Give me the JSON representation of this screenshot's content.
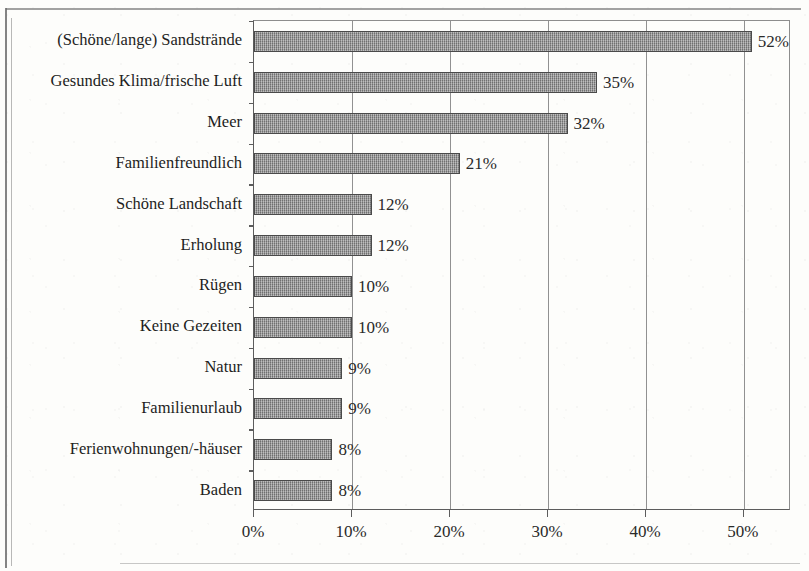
{
  "chart_data": {
    "type": "bar",
    "orientation": "horizontal",
    "title": "",
    "subtitle": "",
    "xlabel": "",
    "ylabel": "",
    "grid": true,
    "legend": null,
    "xlim": [
      0,
      54.8
    ],
    "xtick_values": [
      0,
      10,
      20,
      30,
      40,
      50
    ],
    "xtick_labels": [
      "0%",
      "10%",
      "20%",
      "30%",
      "40%",
      "50%"
    ],
    "value_suffix": "%",
    "categories": [
      "(Schöne/lange) Sandstrände",
      "Gesundes Klima/frische Luft",
      "Meer",
      "Familienfreundlich",
      "Schöne Landschaft",
      "Erholung",
      "Rügen",
      "Keine Gezeiten",
      "Natur",
      "Familienurlaub",
      "Ferienwohnungen/-häuser",
      "Baden"
    ],
    "values": [
      52,
      35,
      32,
      21,
      12,
      12,
      10,
      10,
      9,
      9,
      8,
      8
    ],
    "value_labels": [
      "52%",
      "35%",
      "32%",
      "21%",
      "12%",
      "12%",
      "10%",
      "10%",
      "9%",
      "9%",
      "8%",
      "8%"
    ],
    "colors": {
      "bar_fill": "#8d8d8d",
      "bar_border": "#4a4a4a",
      "axis": "#5c5c5c",
      "grid": "#7e7e7e",
      "text": "#1d1d1d",
      "background": "#fdfdfb"
    }
  }
}
